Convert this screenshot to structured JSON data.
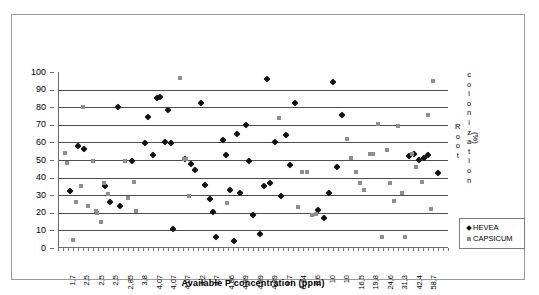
{
  "chart_data": {
    "type": "scatter",
    "title": "",
    "xlabel": "Available P concentration (ppm)",
    "ylabel": "Root colonization (%)",
    "ylim": [
      0,
      100
    ],
    "ytick_step": 10,
    "yticks": [
      "100",
      "90",
      "80",
      "70",
      "60",
      "50",
      "40",
      "30",
      "20",
      "10",
      "0"
    ],
    "grid": "horizontal",
    "legend_position": "bottom-right",
    "categories": [
      "1,7",
      "2,5",
      "2,5",
      "2,5",
      "2,85",
      "3,8",
      "4,07",
      "4,07",
      "4,07",
      "4,2",
      "4,7",
      "4,86",
      "4,89",
      "4,89",
      "4,89",
      "5,7",
      "6,34",
      "6,6",
      "10",
      "10",
      "16,5",
      "19,8",
      "24,6",
      "31,3",
      "42,4",
      "58,7"
    ],
    "series": [
      {
        "name": "HEVEA",
        "marker": "diamond",
        "color": "#111111",
        "points": [
          {
            "x": 1.5,
            "y": 32.5
          },
          {
            "x": 2.6,
            "y": 58.2
          },
          {
            "x": 3.3,
            "y": 56.3
          },
          {
            "x": 6.0,
            "y": 35.2
          },
          {
            "x": 6.6,
            "y": 26.0
          },
          {
            "x": 7.6,
            "y": 80.0
          },
          {
            "x": 7.9,
            "y": 23.6
          },
          {
            "x": 9.4,
            "y": 49.3
          },
          {
            "x": 11.0,
            "y": 59.4
          },
          {
            "x": 11.4,
            "y": 74.4
          },
          {
            "x": 12.0,
            "y": 52.8
          },
          {
            "x": 12.6,
            "y": 85.0
          },
          {
            "x": 12.9,
            "y": 85.6
          },
          {
            "x": 13.6,
            "y": 60.2
          },
          {
            "x": 14.0,
            "y": 78.2
          },
          {
            "x": 14.3,
            "y": 59.4
          },
          {
            "x": 14.6,
            "y": 11.0
          },
          {
            "x": 16.1,
            "y": 50.5
          },
          {
            "x": 16.9,
            "y": 47.7
          },
          {
            "x": 17.4,
            "y": 44.4
          },
          {
            "x": 18.1,
            "y": 82.2
          },
          {
            "x": 18.6,
            "y": 36.0
          },
          {
            "x": 19.3,
            "y": 27.8
          },
          {
            "x": 19.7,
            "y": 20.6
          },
          {
            "x": 20.1,
            "y": 6.0
          },
          {
            "x": 20.9,
            "y": 61.4
          },
          {
            "x": 21.3,
            "y": 53.0
          },
          {
            "x": 21.8,
            "y": 32.8
          },
          {
            "x": 22.3,
            "y": 4.2
          },
          {
            "x": 22.7,
            "y": 65.0
          },
          {
            "x": 23.1,
            "y": 31.0
          },
          {
            "x": 23.9,
            "y": 70.0
          },
          {
            "x": 24.3,
            "y": 49.6
          },
          {
            "x": 24.8,
            "y": 18.5
          },
          {
            "x": 25.6,
            "y": 8.0
          },
          {
            "x": 26.1,
            "y": 35.2
          },
          {
            "x": 26.5,
            "y": 96.0
          },
          {
            "x": 26.9,
            "y": 36.8
          },
          {
            "x": 27.6,
            "y": 60.0
          },
          {
            "x": 28.3,
            "y": 29.8
          },
          {
            "x": 29.0,
            "y": 64.2
          },
          {
            "x": 29.5,
            "y": 47.0
          },
          {
            "x": 30.1,
            "y": 82.6
          },
          {
            "x": 33.0,
            "y": 21.4
          },
          {
            "x": 33.7,
            "y": 16.9
          },
          {
            "x": 34.4,
            "y": 31.4
          },
          {
            "x": 34.9,
            "y": 94.6
          },
          {
            "x": 35.4,
            "y": 45.8
          },
          {
            "x": 36.0,
            "y": 75.3
          },
          {
            "x": 44.6,
            "y": 52.0
          },
          {
            "x": 45.2,
            "y": 53.5
          },
          {
            "x": 45.8,
            "y": 50.0
          },
          {
            "x": 46.4,
            "y": 51.0
          },
          {
            "x": 47.0,
            "y": 53.0
          },
          {
            "x": 48.2,
            "y": 42.8
          }
        ]
      },
      {
        "name": "CAPSICUM",
        "marker": "square",
        "color": "#8e8e8e",
        "points": [
          {
            "x": 0.9,
            "y": 53.8
          },
          {
            "x": 1.1,
            "y": 48.2
          },
          {
            "x": 1.9,
            "y": 4.7
          },
          {
            "x": 2.3,
            "y": 26.2
          },
          {
            "x": 2.9,
            "y": 35.4
          },
          {
            "x": 3.2,
            "y": 80.3
          },
          {
            "x": 3.8,
            "y": 24.0
          },
          {
            "x": 4.4,
            "y": 49.5
          },
          {
            "x": 4.8,
            "y": 20.8
          },
          {
            "x": 5.0,
            "y": 19.9
          },
          {
            "x": 5.5,
            "y": 14.8
          },
          {
            "x": 5.8,
            "y": 37.0
          },
          {
            "x": 6.3,
            "y": 30.4
          },
          {
            "x": 8.5,
            "y": 49.6
          },
          {
            "x": 8.9,
            "y": 28.3
          },
          {
            "x": 9.6,
            "y": 37.7
          },
          {
            "x": 9.9,
            "y": 20.8
          },
          {
            "x": 15.5,
            "y": 96.4
          },
          {
            "x": 16.0,
            "y": 50.7
          },
          {
            "x": 16.2,
            "y": 50.3
          },
          {
            "x": 16.6,
            "y": 29.6
          },
          {
            "x": 21.5,
            "y": 25.6
          },
          {
            "x": 28.0,
            "y": 73.8
          },
          {
            "x": 30.5,
            "y": 23.3
          },
          {
            "x": 31.0,
            "y": 43.2
          },
          {
            "x": 31.6,
            "y": 43.3
          },
          {
            "x": 32.2,
            "y": 18.9
          },
          {
            "x": 32.7,
            "y": 19.5
          },
          {
            "x": 36.7,
            "y": 61.8
          },
          {
            "x": 37.2,
            "y": 51.2
          },
          {
            "x": 37.8,
            "y": 43.0
          },
          {
            "x": 38.3,
            "y": 36.9
          },
          {
            "x": 38.9,
            "y": 33.1
          },
          {
            "x": 39.6,
            "y": 53.3
          },
          {
            "x": 40.0,
            "y": 53.3
          },
          {
            "x": 40.6,
            "y": 70.4
          },
          {
            "x": 41.1,
            "y": 6.2
          },
          {
            "x": 41.7,
            "y": 55.7
          },
          {
            "x": 42.2,
            "y": 37.0
          },
          {
            "x": 42.7,
            "y": 26.7
          },
          {
            "x": 43.2,
            "y": 69.2
          },
          {
            "x": 43.6,
            "y": 31.3
          },
          {
            "x": 44.1,
            "y": 6.2
          },
          {
            "x": 44.9,
            "y": 53.2
          },
          {
            "x": 45.5,
            "y": 46.2
          },
          {
            "x": 46.2,
            "y": 37.6
          },
          {
            "x": 46.9,
            "y": 75.8
          },
          {
            "x": 47.3,
            "y": 22.0
          },
          {
            "x": 47.6,
            "y": 95.0
          }
        ]
      }
    ]
  },
  "axis": {
    "x_title": "Available P concentration (ppm)",
    "y_title_col1": "Root",
    "y_title_col2": "colonization",
    "y_title_unit": "(%)"
  },
  "legend": {
    "items": [
      {
        "label": "HEVEA",
        "marker": "diamond"
      },
      {
        "label": "CAPSICUM",
        "marker": "square"
      }
    ]
  }
}
